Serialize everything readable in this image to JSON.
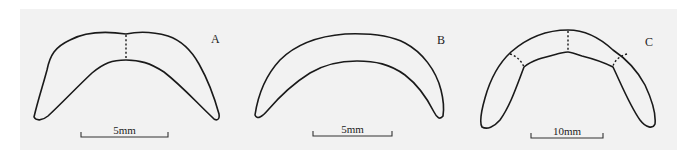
{
  "figure": {
    "background": "#f2f2f2",
    "stroke_color": "#1a1a1a",
    "panels": [
      {
        "id": "A",
        "label": "A",
        "scale_label": "5mm",
        "description": "Crescent-shaped element with a dashed suture at midline"
      },
      {
        "id": "B",
        "label": "B",
        "scale_label": "5mm",
        "description": "Single crescent-shaped element without sutures"
      },
      {
        "id": "C",
        "label": "C",
        "scale_label": "10mm",
        "description": "Crescent-shaped element with a dashed midline suture and two dashed lateral sutures"
      }
    ]
  }
}
